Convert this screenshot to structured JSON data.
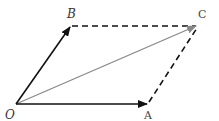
{
  "diagram": {
    "colors": {
      "vector": "#111111",
      "resultant": "#888888",
      "dashed": "#111111",
      "label": "#333333"
    },
    "points": {
      "O": {
        "label": "O",
        "x": 16,
        "y": 104
      },
      "A": {
        "label": "A",
        "x": 148,
        "y": 104
      },
      "B": {
        "label": "B",
        "x": 70,
        "y": 26
      },
      "C": {
        "label": "C",
        "x": 198,
        "y": 25
      }
    },
    "vectors": [
      {
        "from": "O",
        "to": "A",
        "style": "solid-arrow"
      },
      {
        "from": "O",
        "to": "B",
        "style": "solid-arrow"
      },
      {
        "from": "O",
        "to": "C",
        "style": "gray-arrow"
      }
    ],
    "dashed_edges": [
      {
        "from": "B",
        "to": "C"
      },
      {
        "from": "A",
        "to": "C"
      }
    ]
  }
}
